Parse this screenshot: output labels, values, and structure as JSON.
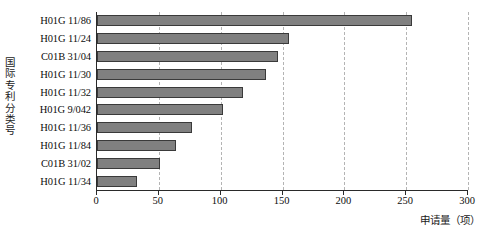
{
  "chart_data": {
    "type": "bar",
    "orientation": "horizontal",
    "title": "",
    "xlabel": "申请量（项）",
    "ylabel": "国际专利分类号",
    "categories": [
      "H01G 11/86",
      "H01G 11/24",
      "C01B 31/04",
      "H01G 11/30",
      "H01G 11/32",
      "H01G 9/042",
      "H01G 11/36",
      "H01G 11/84",
      "C01B 31/02",
      "H01G 11/34"
    ],
    "values": [
      255,
      155,
      146,
      137,
      118,
      102,
      77,
      64,
      51,
      32
    ],
    "xlim": [
      0,
      300
    ],
    "xticks": [
      0,
      50,
      100,
      150,
      200,
      250,
      300
    ],
    "xtick_labels": [
      "0",
      "50",
      "100",
      "150",
      "200",
      "250",
      "300"
    ],
    "grid": true,
    "grid_axis": "x",
    "grid_style": "dashed",
    "legend": false,
    "bar_color": "#808080",
    "bar_edge_color": "#3a3a3a",
    "grid_color": "#b4b4b4",
    "axis_color": "#2a2a2a"
  },
  "y_axis_title_chars": [
    "国",
    "际",
    "专",
    "利",
    "分",
    "类",
    "号"
  ]
}
